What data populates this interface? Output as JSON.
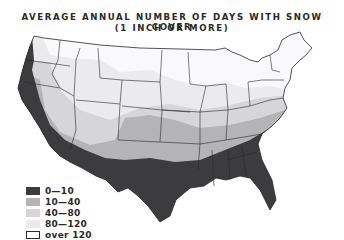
{
  "title": {
    "line1": "AVERAGE ANNUAL NUMBER OF DAYS WITH SNOW COVER",
    "line2": "(1 INCH OR MORE)"
  },
  "map": {
    "region": "Contiguous United States",
    "colors": {
      "c0_10": "#3c3c3e",
      "c10_40": "#b4b4b6",
      "c40_80": "#d6d6d8",
      "c80_120": "#ebebed",
      "over120": "#f9f9fb",
      "border": "#2a2a2a"
    }
  },
  "legend": {
    "items": [
      {
        "label": "0—10",
        "color": "#3c3c3e"
      },
      {
        "label": "10—40",
        "color": "#b4b4b6"
      },
      {
        "label": "40—80",
        "color": "#d6d6d8"
      },
      {
        "label": "80—120",
        "color": "#ebebed"
      },
      {
        "label": "over 120",
        "color": "#ffffff",
        "outlined": true
      }
    ]
  }
}
